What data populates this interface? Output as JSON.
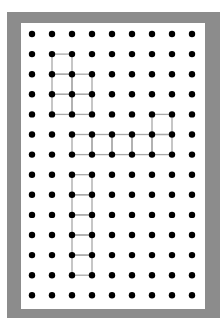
{
  "diagram": {
    "type": "dot-grid",
    "grid": {
      "columns": 9,
      "rows": 14,
      "origin_x": 32,
      "origin_y": 34,
      "spacing_x": 20,
      "spacing_y": 20.1
    },
    "colors": {
      "frame": "#8c8c8c",
      "paper": "#ffffff",
      "dot": "#000000",
      "line": "#a8a8a8"
    },
    "shapes": [
      {
        "name": "shape-1-pentomino",
        "squares": [
          [
            1,
            1
          ],
          [
            1,
            2
          ],
          [
            2,
            2
          ],
          [
            1,
            3
          ],
          [
            2,
            3
          ]
        ]
      },
      {
        "name": "shape-2-hexomino",
        "squares": [
          [
            6,
            4
          ],
          [
            2,
            5
          ],
          [
            3,
            5
          ],
          [
            4,
            5
          ],
          [
            5,
            5
          ],
          [
            6,
            5
          ]
        ]
      },
      {
        "name": "shape-3-pentomino-column",
        "squares": [
          [
            2,
            7
          ],
          [
            2,
            8
          ],
          [
            2,
            9
          ],
          [
            2,
            10
          ],
          [
            2,
            11
          ]
        ]
      }
    ]
  }
}
